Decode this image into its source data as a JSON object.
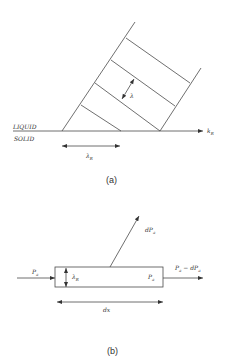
{
  "panel_a": {
    "caption": "(a)",
    "liquid_label": "LIQUID",
    "solid_label": "SOLID",
    "lambda_label": "λ",
    "lambda_r_label": "λ",
    "lambda_r_sub": "R",
    "k_r_label": "k",
    "k_r_sub": "R"
  },
  "panel_b": {
    "caption": "(b)",
    "p_in_label": "P",
    "p_in_sub": "a",
    "lambda_r_label": "λ",
    "lambda_r_sub": "R",
    "p_inside_label": "P",
    "p_inside_sub": "a",
    "p_out_label": "P",
    "p_out_sub": "a",
    "p_out_minus": " − dP",
    "p_out_minus_sub": "a",
    "dp_label": "dP",
    "dp_sub": "a",
    "dx_label": "dx"
  }
}
